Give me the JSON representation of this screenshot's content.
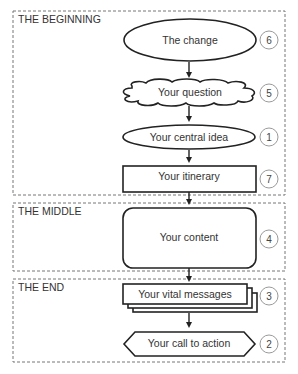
{
  "sections": [
    {
      "label": "THE BEGINNING"
    },
    {
      "label": "THE MIDDLE"
    },
    {
      "label": "THE END"
    }
  ],
  "steps": [
    {
      "label": "The change",
      "shape": "ellipse",
      "number": "6"
    },
    {
      "label": "Your question",
      "shape": "cloud",
      "number": "5"
    },
    {
      "label": "Your central idea",
      "shape": "ellipse",
      "number": "1"
    },
    {
      "label": "Your itinerary",
      "shape": "rectangle",
      "number": "7"
    },
    {
      "label": "Your content",
      "shape": "rounded-rectangle",
      "number": "4"
    },
    {
      "label": "Your vital messages",
      "shape": "stacked-documents",
      "number": "3"
    },
    {
      "label": "Your call to action",
      "shape": "hexagon",
      "number": "2"
    }
  ],
  "colors": {
    "stroke": "#222222",
    "dashed_border": "#777777",
    "badge_border": "#9a9a9a",
    "background": "#ffffff"
  }
}
